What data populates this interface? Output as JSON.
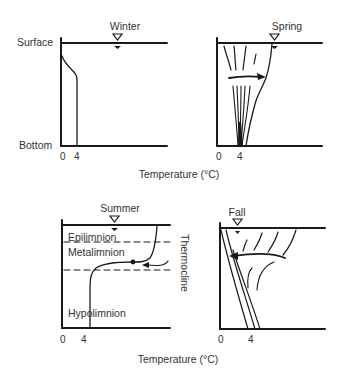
{
  "figure": {
    "axis_labels": {
      "surface": "Surface",
      "bottom": "Bottom",
      "x_axis_top": "Temperature (°C)",
      "x_axis_bottom": "Temperature (°C)"
    },
    "panels": [
      {
        "id": "winter",
        "title": "Winter",
        "ticks": [
          "0",
          "4"
        ]
      },
      {
        "id": "spring",
        "title": "Spring",
        "ticks": [
          "0",
          "4"
        ]
      },
      {
        "id": "summer",
        "title": "Summer",
        "ticks": [
          "0",
          "4"
        ],
        "layers": [
          "Epilimnion",
          "Metalimnion",
          "Hypolimnion"
        ],
        "side_label": "Thermocline"
      },
      {
        "id": "fall",
        "title": "Fall",
        "ticks": [
          "0",
          "4"
        ]
      }
    ]
  },
  "colors": {
    "ink": "#1a1a1a",
    "text": "#333333",
    "background": "#ffffff"
  }
}
